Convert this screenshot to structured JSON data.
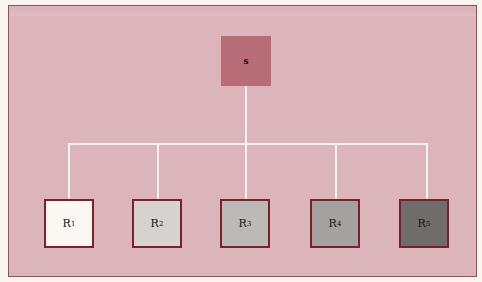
{
  "diagram": {
    "type": "tree",
    "root": {
      "label": "s",
      "color": "#b86c77"
    },
    "children": [
      {
        "label": "R",
        "subscript": "1",
        "fill": "#fbf7f3"
      },
      {
        "label": "R",
        "subscript": "2",
        "fill": "#d6d3cf"
      },
      {
        "label": "R",
        "subscript": "3",
        "fill": "#bcbab7"
      },
      {
        "label": "R",
        "subscript": "4",
        "fill": "#a4a2a0"
      },
      {
        "label": "R",
        "subscript": "5",
        "fill": "#6f6d6c"
      }
    ],
    "colors": {
      "panel": "#dcb5ba",
      "panel_border": "#9a4d59",
      "child_border": "#7d1f2c",
      "connector": "#fbf2ee",
      "page_background": "#fbf5ef"
    }
  }
}
